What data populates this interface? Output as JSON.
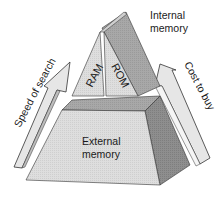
{
  "labels": {
    "internal_memory": [
      "Internal",
      "memory"
    ],
    "external_memory": [
      "External",
      "memory"
    ],
    "ram": "RAM",
    "rom": "ROM",
    "speed_of_search": "Speed of search",
    "cost_to_buy": "Cost to buy"
  },
  "colors": {
    "light_face": "#dcdcdc",
    "mid_face": "#a9a9a9",
    "dark_face": "#8c8c8c",
    "outline": "#333333",
    "arrow_fill": "#e4e4e4"
  }
}
